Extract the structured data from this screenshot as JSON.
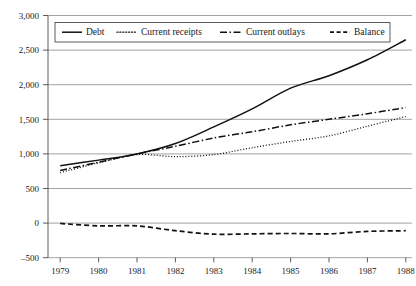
{
  "chart_data": {
    "type": "line",
    "title": "",
    "subtitle": "",
    "xlabel": "",
    "ylabel": "",
    "x": [
      1979,
      1980,
      1981,
      1982,
      1983,
      1984,
      1985,
      1986,
      1987,
      1988
    ],
    "categories": [
      "1979",
      "1980",
      "1981",
      "1982",
      "1983",
      "1984",
      "1985",
      "1986",
      "1987",
      "1988"
    ],
    "series": [
      {
        "name": "Debt",
        "style": "solid",
        "color": "#111111",
        "values": [
          830,
          910,
          1000,
          1150,
          1390,
          1650,
          1950,
          2130,
          2360,
          2650
        ]
      },
      {
        "name": "Current receipts",
        "style": "dotted",
        "color": "#111111",
        "values": [
          730,
          870,
          990,
          960,
          990,
          1090,
          1180,
          1260,
          1400,
          1540
        ]
      },
      {
        "name": "Current outlays",
        "style": "dash-dot",
        "color": "#111111",
        "values": [
          760,
          880,
          1000,
          1110,
          1230,
          1320,
          1420,
          1500,
          1580,
          1670
        ]
      },
      {
        "name": "Balance",
        "style": "dashed",
        "color": "#111111",
        "values": [
          -5,
          -40,
          -40,
          -110,
          -160,
          -155,
          -150,
          -155,
          -120,
          -110
        ]
      }
    ],
    "ylim": [
      -500,
      3000
    ],
    "ytick_values": [
      3000,
      2500,
      2000,
      1500,
      1000,
      500,
      0,
      -500
    ],
    "ytick_labels": [
      "3,000",
      "2,500",
      "2,000",
      "1,500",
      "1,000",
      "500",
      "0",
      "–500"
    ],
    "xtick_labels": [
      "1979",
      "1980",
      "1981",
      "1982",
      "1983",
      "1984",
      "1985",
      "1986",
      "1987",
      "1988"
    ],
    "grid": true,
    "grid_axis": "y",
    "legend_position": "top-inside",
    "legend_entries": [
      {
        "label": "Debt",
        "style": "solid"
      },
      {
        "label": "Current receipts",
        "style": "dotted"
      },
      {
        "label": "Current outlays",
        "style": "dash-dot"
      },
      {
        "label": "Balance",
        "style": "dashed"
      }
    ]
  },
  "legend": {
    "debt_label": "Debt",
    "receipts_label": "Current receipts",
    "outlays_label": "Current outlays",
    "balance_label": "Balance"
  },
  "yaxis": {
    "t0": "3,000",
    "t1": "2,500",
    "t2": "2,000",
    "t3": "1,500",
    "t4": "1,000",
    "t5": "500",
    "t6": "0",
    "t7": "–500"
  },
  "xaxis": {
    "t0": "1979",
    "t1": "1980",
    "t2": "1981",
    "t3": "1982",
    "t4": "1983",
    "t5": "1984",
    "t6": "1985",
    "t7": "1986",
    "t8": "1987",
    "t9": "1988"
  },
  "colors": {
    "ink": "#111111",
    "grid": "#8a8a8a",
    "axis": "#4a4a4a",
    "background": "#ffffff"
  }
}
